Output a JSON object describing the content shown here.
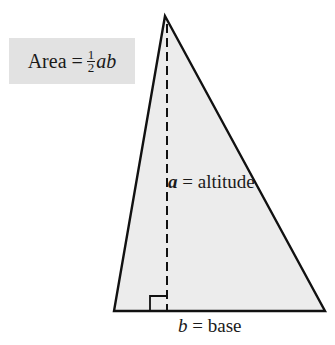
{
  "diagram": {
    "formula": {
      "prefix": "Area =",
      "fraction_numerator": "1",
      "fraction_denominator": "2",
      "suffix": "ab"
    },
    "labels": {
      "altitude_var": "a",
      "altitude_text": "= altitude",
      "base_var": "b",
      "base_text": "= base"
    },
    "shape": {
      "type": "triangle",
      "apex": [
        165,
        16
      ],
      "base_left": [
        114,
        311
      ],
      "base_right": [
        325,
        311
      ],
      "altitude_x": 167,
      "right_angle_box": [
        150,
        296,
        17,
        15
      ]
    },
    "colors": {
      "fill": "#ececec",
      "stroke": "#111111",
      "formula_bg": "#e2e2e2"
    }
  }
}
